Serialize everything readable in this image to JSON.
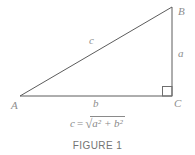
{
  "figure": {
    "labels": {
      "vertex_a": "A",
      "vertex_b": "B",
      "vertex_c": "C",
      "side_c": "c",
      "side_a": "a",
      "side_b": "b"
    },
    "formula": {
      "lhs": "c",
      "eq": "=",
      "sqrt": "√",
      "radicand": "a² + b²"
    },
    "caption": "FIGURE 1",
    "colors": {
      "line": "#5c5c5c",
      "label": "#8e8e8e",
      "formula": "#8a8a8a",
      "caption": "#737373"
    }
  }
}
